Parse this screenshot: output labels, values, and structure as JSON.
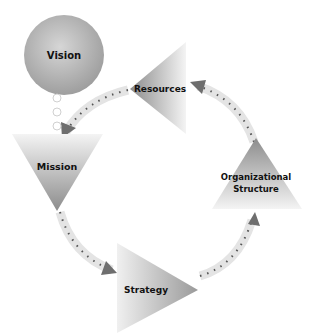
{
  "diagram": {
    "nodes": [
      {
        "id": "vision",
        "label": "Vision",
        "shape": "circle"
      },
      {
        "id": "resources",
        "label": "Resources",
        "shape": "triangle-left"
      },
      {
        "id": "mission",
        "label": "Mission",
        "shape": "triangle-down"
      },
      {
        "id": "strategy",
        "label": "Strategy",
        "shape": "triangle-right"
      },
      {
        "id": "org",
        "label_line1": "Organizational",
        "label_line2": "Structure",
        "shape": "triangle-up"
      }
    ],
    "edges": [
      {
        "from": "vision",
        "to": "mission",
        "style": "dotted-circles"
      },
      {
        "from": "resources",
        "to": "mission",
        "style": "dashed-arrow"
      },
      {
        "from": "mission",
        "to": "strategy",
        "style": "dashed-arrow"
      },
      {
        "from": "strategy",
        "to": "org",
        "style": "dashed-arrow"
      },
      {
        "from": "org",
        "to": "resources",
        "style": "dashed-arrow"
      }
    ],
    "colors": {
      "shape_dark": "#8a8a8a",
      "shape_light": "#f2f2f2",
      "arrow_band": "#e6e6e6",
      "arrow_dot": "#555555",
      "arrow_head": "#6e6e6e"
    }
  }
}
